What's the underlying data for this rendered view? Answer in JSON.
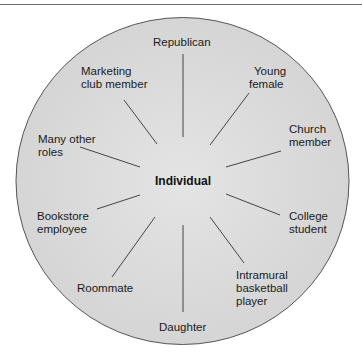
{
  "diagram": {
    "center_label": "Individual",
    "roles": [
      {
        "id": "republican",
        "lines": [
          "Republican"
        ]
      },
      {
        "id": "young-female",
        "lines": [
          "Young",
          "female"
        ]
      },
      {
        "id": "church-member",
        "lines": [
          "Church",
          "member"
        ]
      },
      {
        "id": "college-student",
        "lines": [
          "College",
          "student"
        ]
      },
      {
        "id": "intramural-basketball-player",
        "lines": [
          "Intramural",
          "basketball",
          "player"
        ]
      },
      {
        "id": "daughter",
        "lines": [
          "Daughter"
        ]
      },
      {
        "id": "roommate",
        "lines": [
          "Roommate"
        ]
      },
      {
        "id": "bookstore-employee",
        "lines": [
          "Bookstore",
          "employee"
        ]
      },
      {
        "id": "many-other-roles",
        "lines": [
          "Many other",
          "roles"
        ]
      },
      {
        "id": "marketing-club-member",
        "lines": [
          "Marketing",
          "club member"
        ]
      }
    ],
    "colors": {
      "circle_fill": "#d9d9d9",
      "circle_stroke": "#555555",
      "spoke": "#333333",
      "rule": "#6b6b6b"
    }
  }
}
